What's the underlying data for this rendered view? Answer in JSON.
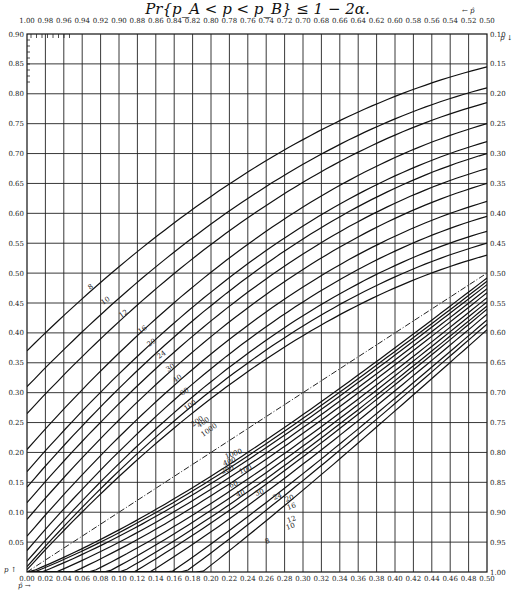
{
  "title": "Pr{p_A < p < p_B} ≤ 1 − 2α.",
  "chart_data": {
    "type": "line",
    "title": "Pr{p_A < p < p_B} ≤ 1 − 2α.",
    "xlabel_bottom": "p̂ →",
    "xlabel_top": "← p̂",
    "ylabel_left": "p ↑",
    "ylabel_right": "p ↓",
    "x_bottom_ticks": [
      "0.00",
      "0.02",
      "0.04",
      "0.06",
      "0.08",
      "0.10",
      "0.12",
      "0.14",
      "0.16",
      "0.18",
      "0.20",
      "0.22",
      "0.24",
      "0.26",
      "0.28",
      "0.30",
      "0.32",
      "0.34",
      "0.36",
      "0.38",
      "0.40",
      "0.42",
      "0.44",
      "0.46",
      "0.48",
      "0.50"
    ],
    "x_top_ticks": [
      "1.00",
      "0.98",
      "0.96",
      "0.94",
      "0.92",
      "0.90",
      "0.88",
      "0.86",
      "0.84",
      "0.82",
      "0.80",
      "0.78",
      "0.76",
      "0.74",
      "0.72",
      "0.70",
      "0.68",
      "0.66",
      "0.64",
      "0.62",
      "0.60",
      "0.58",
      "0.56",
      "0.54",
      "0.52",
      "0.50"
    ],
    "y_left_ticks": [
      "0.90",
      "0.85",
      "0.80",
      "0.75",
      "0.70",
      "0.65",
      "0.60",
      "0.55",
      "0.50",
      "0.45",
      "0.40",
      "0.35",
      "0.30",
      "0.25",
      "0.20",
      "0.15",
      "0.10",
      "0.05"
    ],
    "y_right_ticks": [
      "0.10",
      "0.15",
      "0.20",
      "0.25",
      "0.30",
      "0.35",
      "0.40",
      "0.45",
      "0.50",
      "0.55",
      "0.60",
      "0.65",
      "0.70",
      "0.75",
      "0.80",
      "0.85",
      "0.90",
      "0.95",
      "1.00"
    ],
    "xlim": [
      0,
      0.5
    ],
    "ylim": [
      0,
      0.9
    ],
    "grid": true,
    "sample_sizes": [
      8,
      10,
      12,
      16,
      20,
      24,
      30,
      40,
      60,
      100,
      200,
      400,
      1000
    ],
    "upper_curves_at_phat_0": {
      "8": 0.37,
      "10": 0.31,
      "12": 0.265,
      "16": 0.205,
      "20": 0.168,
      "24": 0.142,
      "30": 0.116,
      "40": 0.088,
      "60": 0.06,
      "100": 0.036,
      "200": 0.018,
      "400": 0.009,
      "1000": 0.004
    },
    "upper_curves_at_phat_0_5": {
      "8": 0.845,
      "10": 0.81,
      "12": 0.785,
      "16": 0.75,
      "20": 0.72,
      "24": 0.7,
      "30": 0.675,
      "40": 0.65,
      "60": 0.62,
      "100": 0.595,
      "200": 0.57,
      "400": 0.55,
      "1000": 0.53
    },
    "diagonal_line": "dash-dot p = p̂",
    "annotations": [
      "8",
      "10",
      "12",
      "16",
      "20",
      "24",
      "30",
      "40",
      "60",
      "100",
      "200",
      "400",
      "1000"
    ]
  }
}
